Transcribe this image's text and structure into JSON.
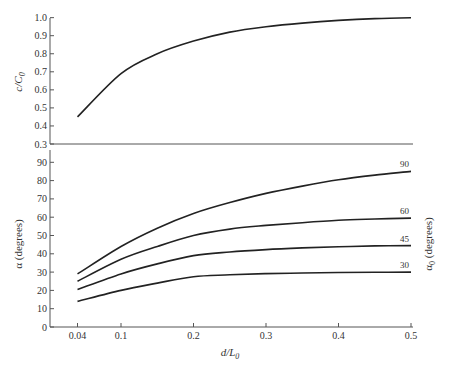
{
  "chart_data": [
    {
      "type": "line",
      "panel": "top",
      "title": "",
      "xlabel": "d/L0",
      "ylabel": "c/C0",
      "xlim": [
        0,
        0.5
      ],
      "ylim": [
        0.3,
        1.0
      ],
      "x_ticks": [
        0.04,
        0.1,
        0.2,
        0.3,
        0.4,
        0.5
      ],
      "y_ticks": [
        0.3,
        0.4,
        0.5,
        0.6,
        0.7,
        0.8,
        0.9,
        1.0
      ],
      "y_tick_labels": [
        "0.3",
        "0.4",
        "0.5",
        "0.6",
        "0.7",
        "0.8",
        "0.9",
        "1.0"
      ],
      "grid": false,
      "x": [
        0.04,
        0.1,
        0.15,
        0.2,
        0.25,
        0.3,
        0.35,
        0.4,
        0.45,
        0.5
      ],
      "series": [
        {
          "name": "c/C0",
          "values": [
            0.45,
            0.69,
            0.8,
            0.87,
            0.92,
            0.95,
            0.97,
            0.985,
            0.995,
            1.0
          ]
        }
      ]
    },
    {
      "type": "line",
      "panel": "bottom",
      "title": "",
      "xlabel": "d/L0",
      "ylabel": "α (degrees)",
      "ylabel_right": "α0 (degrees)",
      "xlim": [
        0,
        0.5
      ],
      "ylim": [
        0,
        90
      ],
      "x_ticks": [
        0.04,
        0.1,
        0.2,
        0.3,
        0.4,
        0.5
      ],
      "x_tick_labels": [
        "0.04",
        "0.1",
        "0.2",
        "0.3",
        "0.4",
        "0.5"
      ],
      "y_ticks": [
        0,
        10,
        20,
        30,
        40,
        50,
        60,
        70,
        80,
        90
      ],
      "y_tick_labels": [
        "0",
        "10",
        "20",
        "30",
        "40",
        "50",
        "60",
        "70",
        "80",
        "90"
      ],
      "grid": false,
      "legend_position": "curve end labels (right)",
      "x": [
        0.04,
        0.1,
        0.15,
        0.2,
        0.25,
        0.3,
        0.35,
        0.4,
        0.45,
        0.5
      ],
      "series": [
        {
          "name": "90",
          "values": [
            29,
            44,
            54,
            62,
            68,
            73,
            77,
            80.5,
            83,
            85
          ]
        },
        {
          "name": "60",
          "values": [
            25,
            37,
            44,
            50,
            53.5,
            55.5,
            57,
            58.3,
            59,
            59.5
          ]
        },
        {
          "name": "45",
          "values": [
            20.5,
            29,
            34.5,
            39,
            41,
            42.3,
            43.2,
            43.8,
            44.3,
            44.5
          ]
        },
        {
          "name": "30",
          "values": [
            14,
            20,
            24,
            27.5,
            28.5,
            29.2,
            29.5,
            29.8,
            29.9,
            30
          ]
        }
      ]
    }
  ],
  "labels": {
    "top_ylabel_main": "c/C",
    "top_ylabel_sub": "0",
    "bottom_ylabel": "α  (degrees)",
    "right_ylabel_main": "α",
    "right_ylabel_sub": "0",
    "right_ylabel_rest": " (degrees)",
    "xlabel_main": "d/L",
    "xlabel_sub": "0"
  }
}
